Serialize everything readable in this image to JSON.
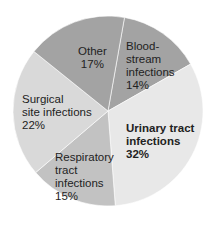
{
  "chart_data": {
    "type": "pie",
    "title": "",
    "start_angle_deg": 10,
    "direction": "clockwise",
    "slices": [
      {
        "label": "Blood-stream infections",
        "value": 14,
        "color": "#a3a3a3"
      },
      {
        "label": "Urinary tract infections",
        "value": 32,
        "color": "#e8e8e8",
        "emphasis": "bold"
      },
      {
        "label": "Respiratory tract infections",
        "value": 15,
        "color": "#c2c2c2"
      },
      {
        "label": "Surgical site infections",
        "value": 22,
        "color": "#d9d9d9"
      },
      {
        "label": "Other",
        "value": 17,
        "color": "#a3a3a3"
      }
    ]
  },
  "labels": {
    "blood": {
      "l1": "Blood-",
      "l2": "stream",
      "l3": "infections",
      "pct": "14%"
    },
    "urinary": {
      "l1": "Urinary tract",
      "l2": "infections",
      "pct": "32%"
    },
    "respiratory": {
      "l1": "Respiratory",
      "l2": "tract",
      "l3": "infections",
      "pct": "15%"
    },
    "surgical": {
      "l1": "Surgical",
      "l2": "site infections",
      "pct": "22%"
    },
    "other": {
      "l1": "Other",
      "pct": "17%"
    }
  }
}
